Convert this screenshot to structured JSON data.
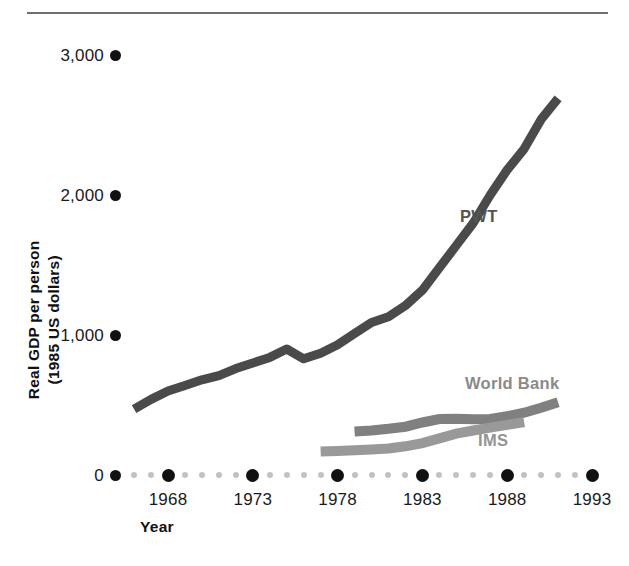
{
  "figure": {
    "has_top_rule": true,
    "background": "#ffffff"
  },
  "axes": {
    "y": {
      "title_line1": "Real GDP per person",
      "title_line2": "(1985 US dollars)",
      "ticks": [
        {
          "label": "0",
          "value": 0
        },
        {
          "label": "1,000",
          "value": 1000
        },
        {
          "label": "2,000",
          "value": 2000
        },
        {
          "label": "3,000",
          "value": 3000
        }
      ],
      "range": [
        0,
        3200
      ]
    },
    "x": {
      "title": "Year",
      "ticks": [
        {
          "label": "1968",
          "value": 1968
        },
        {
          "label": "1973",
          "value": 1973
        },
        {
          "label": "1978",
          "value": 1978
        },
        {
          "label": "1983",
          "value": 1983
        },
        {
          "label": "1988",
          "value": 1988
        },
        {
          "label": "1993",
          "value": 1993
        }
      ],
      "range": [
        1965,
        1994
      ],
      "minor_step": 1
    }
  },
  "annotations": [
    {
      "name": "pwt",
      "text": "PWT",
      "color": "#545454"
    },
    {
      "name": "world-bank",
      "text": "World Bank",
      "color": "#8a8a8a"
    },
    {
      "name": "ims",
      "text": "IMS",
      "color": "#949494"
    }
  ],
  "chart_data": {
    "type": "line",
    "title": "",
    "subtitle": "",
    "xlabel": "Year",
    "ylabel": "Real GDP per person (1985 US dollars)",
    "xlim": [
      1965,
      1994
    ],
    "ylim": [
      0,
      3200
    ],
    "xticks": [
      1968,
      1973,
      1978,
      1983,
      1988,
      1993
    ],
    "yticks": [
      0,
      1000,
      2000,
      3000
    ],
    "grid": false,
    "legend": "inline-annotations",
    "series": [
      {
        "name": "PWT",
        "color": "#4a4a4a",
        "x": [
          1966,
          1967,
          1968,
          1969,
          1970,
          1971,
          1972,
          1973,
          1974,
          1975,
          1976,
          1977,
          1978,
          1979,
          1980,
          1981,
          1982,
          1983,
          1984,
          1985,
          1986,
          1987,
          1988,
          1989,
          1990,
          1991
        ],
        "values": [
          470,
          540,
          600,
          640,
          680,
          710,
          760,
          800,
          840,
          900,
          830,
          870,
          930,
          1010,
          1090,
          1130,
          1210,
          1320,
          1480,
          1640,
          1800,
          2000,
          2180,
          2330,
          2540,
          2690
        ]
      },
      {
        "name": "World Bank",
        "color": "#808080",
        "x": [
          1979,
          1980,
          1981,
          1982,
          1983,
          1984,
          1985,
          1986,
          1987,
          1988,
          1989,
          1990,
          1991
        ],
        "values": [
          310,
          318,
          330,
          345,
          375,
          400,
          402,
          398,
          400,
          420,
          445,
          480,
          520
        ]
      },
      {
        "name": "IMS",
        "color": "#999999",
        "x": [
          1977,
          1978,
          1979,
          1980,
          1981,
          1982,
          1983,
          1984,
          1985,
          1986,
          1987,
          1988,
          1989
        ],
        "values": [
          168,
          172,
          176,
          182,
          190,
          205,
          228,
          262,
          295,
          318,
          338,
          358,
          378
        ]
      }
    ]
  }
}
